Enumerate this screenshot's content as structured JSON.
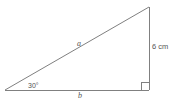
{
  "diagram": {
    "name": "right-triangle-trigonometry-diagram",
    "type": "geometry-figure",
    "stroke_color": "#808080",
    "text_color": "#555555",
    "background_color": "#ffffff",
    "vertices": {
      "left": [
        5,
        90
      ],
      "bottom_right": [
        149,
        90
      ],
      "top_right": [
        149,
        7
      ]
    },
    "labels": {
      "angle": "30°",
      "hypotenuse": "a",
      "base": "b",
      "height": "6 cm"
    },
    "markers": {
      "right_angle_name": "right-angle-square-marker",
      "right_angle_size": 8
    }
  }
}
